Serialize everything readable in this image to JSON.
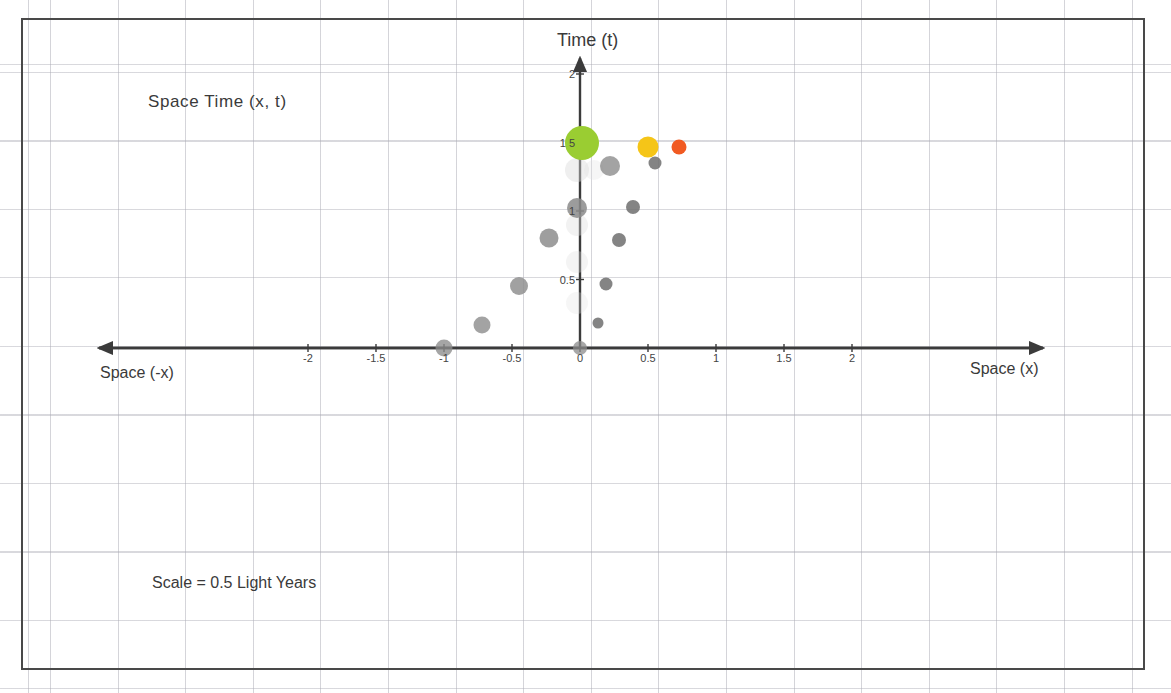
{
  "figure": {
    "title": "Space Time  (x, t)",
    "scale_note": "Scale = 0.5 Light Years",
    "y_axis_label": "Time (t)",
    "x_axis_label_right": "Space (x)",
    "x_axis_label_left": "Space (-x)"
  },
  "chart_data": {
    "type": "scatter",
    "title": "Space Time  (x, t)",
    "xlabel": "Space (x)",
    "ylabel": "Time (t)",
    "annotations": [
      "Space Time  (x, t)",
      "Scale = 0.5 Light Years",
      "Time (t)",
      "Space (x)",
      "Space (-x)"
    ],
    "grid": true,
    "legend": "none",
    "xlim": [
      -2.5,
      2.6
    ],
    "ylim": [
      -1.9,
      2.15
    ],
    "xticks": [
      -2,
      -1.5,
      -1,
      -0.5,
      0,
      0.5,
      1,
      1.5,
      2
    ],
    "xticklabels": [
      "-2",
      "-1.5",
      "-1",
      "-0.5",
      "0",
      "0.5",
      "1",
      "1.5",
      "2"
    ],
    "yticks": [
      0.5,
      1,
      1.5,
      2
    ],
    "yticklabels": [
      "0.5",
      "1",
      "1 5",
      "2"
    ],
    "scale_light_years": 0.5,
    "series": [
      {
        "name": "left-arm-grey",
        "color": "#8a8a8a",
        "points": [
          {
            "x": -1.0,
            "y": 0.0,
            "r": 8.5,
            "color": "#8c8c8c",
            "opacity": 0.78
          },
          {
            "x": -0.72,
            "y": 0.17,
            "r": 8.5,
            "color": "#8c8c8c",
            "opacity": 0.8
          },
          {
            "x": -0.45,
            "y": 0.45,
            "r": 9.0,
            "color": "#8c8c8c",
            "opacity": 0.82
          },
          {
            "x": -0.23,
            "y": 0.8,
            "r": 9.5,
            "color": "#8c8c8c",
            "opacity": 0.84
          },
          {
            "x": -0.02,
            "y": 1.02,
            "r": 10.0,
            "color": "#8c8c8c",
            "opacity": 0.86
          }
        ]
      },
      {
        "name": "right-arm-grey",
        "color": "#6f6f6f",
        "points": [
          {
            "x": 0.13,
            "y": 0.18,
            "r": 5.5,
            "color": "#6f6f6f",
            "opacity": 0.85
          },
          {
            "x": 0.19,
            "y": 0.47,
            "r": 6.5,
            "color": "#6f6f6f",
            "opacity": 0.85
          },
          {
            "x": 0.29,
            "y": 0.79,
            "r": 7.0,
            "color": "#6f6f6f",
            "opacity": 0.85
          },
          {
            "x": 0.39,
            "y": 1.03,
            "r": 7.0,
            "color": "#6f6f6f",
            "opacity": 0.85
          },
          {
            "x": 0.55,
            "y": 1.35,
            "r": 6.5,
            "color": "#6f6f6f",
            "opacity": 0.85
          },
          {
            "x": 0.22,
            "y": 1.33,
            "r": 10.0,
            "color": "#8c8c8c",
            "opacity": 0.8
          }
        ]
      },
      {
        "name": "origin-marker",
        "color": "#7d7d7d",
        "points": [
          {
            "x": 0.0,
            "y": 0.0,
            "r": 7.0,
            "color": "#8b8b8b",
            "opacity": 0.75
          }
        ]
      },
      {
        "name": "doppler-shifted-sources",
        "color": "#9acd32",
        "points": [
          {
            "x": 0.015,
            "y": 1.5,
            "r": 17.0,
            "color": "#9acd32",
            "opacity": 1.0,
            "label": "green"
          },
          {
            "x": 0.5,
            "y": 1.47,
            "r": 10.5,
            "color": "#f5c518",
            "opacity": 1.0,
            "label": "yellow"
          },
          {
            "x": 0.73,
            "y": 1.47,
            "r": 7.5,
            "color": "#f15a22",
            "opacity": 1.0,
            "label": "orange"
          }
        ]
      },
      {
        "name": "ghost-column-faint",
        "color": "#dcdcdc",
        "points": [
          {
            "x": -0.02,
            "y": 1.3,
            "r": 12.0,
            "color": "#d8d8d8",
            "opacity": 0.42
          },
          {
            "x": -0.02,
            "y": 0.9,
            "r": 11.0,
            "color": "#dedede",
            "opacity": 0.38
          },
          {
            "x": -0.02,
            "y": 0.63,
            "r": 11.0,
            "color": "#e0e0e0",
            "opacity": 0.34
          },
          {
            "x": -0.02,
            "y": 0.33,
            "r": 11.0,
            "color": "#e2e2e2",
            "opacity": 0.3
          },
          {
            "x": 0.1,
            "y": 1.3,
            "r": 10.0,
            "color": "#e2e2e2",
            "opacity": 0.3
          }
        ]
      }
    ]
  },
  "axes": {
    "x_ticks": [
      {
        "value": -2,
        "label": "-2"
      },
      {
        "value": -1.5,
        "label": "-1.5"
      },
      {
        "value": -1,
        "label": "-1"
      },
      {
        "value": -0.5,
        "label": "-0.5"
      },
      {
        "value": 0,
        "label": "0"
      },
      {
        "value": 0.5,
        "label": "0.5"
      },
      {
        "value": 1,
        "label": "1"
      },
      {
        "value": 1.5,
        "label": "1.5"
      },
      {
        "value": 2,
        "label": "2"
      }
    ],
    "y_ticks": [
      {
        "value": 0.5,
        "label": "0.5"
      },
      {
        "value": 1,
        "label": "1"
      },
      {
        "value": 1.5,
        "label": "1 5"
      },
      {
        "value": 2,
        "label": "2"
      }
    ],
    "axis_color": "#3b3b3b"
  },
  "colors": {
    "green": "#9acd32",
    "yellow": "#f5c518",
    "orange": "#f15a22",
    "grey_light": "#8c8c8c",
    "grey_dark": "#6f6f6f",
    "axis": "#3b3b3b",
    "frame": "#494949",
    "grid": "#aaaab4"
  }
}
